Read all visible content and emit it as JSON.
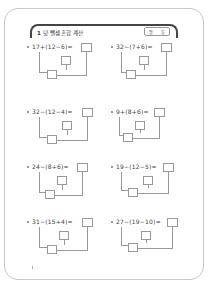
{
  "header": {
    "number": "1",
    "title": "덧·뺄셈 혼합 계산",
    "date_month_label": "월",
    "date_day_label": "일"
  },
  "problems": [
    {
      "expr": "17+(12−6)="
    },
    {
      "expr": "32−(7+6)="
    },
    {
      "expr": "32−(12−4)="
    },
    {
      "expr": "9+(8+6)="
    },
    {
      "expr": "24−(8+6)="
    },
    {
      "expr": "19−(12−5)="
    },
    {
      "expr": "31−(15+4)="
    },
    {
      "expr": "27−(19−10)="
    }
  ]
}
